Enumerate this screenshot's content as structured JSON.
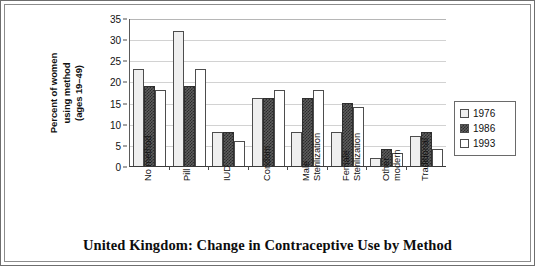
{
  "caption": "United Kingdom: Change in Contraceptive Use by Method",
  "axis": {
    "ylabel": "Percent of women\nusing method\n(ages 19–49)"
  },
  "legend": {
    "items": [
      {
        "label": "1976",
        "swatch": "light-dotted-swatch"
      },
      {
        "label": "1986",
        "swatch": "dark-hatched-swatch"
      },
      {
        "label": "1993",
        "swatch": "white-swatch"
      }
    ]
  },
  "chart_data": {
    "type": "bar",
    "title": "United Kingdom: Change in Contraceptive Use by Method",
    "xlabel": "",
    "ylabel": "Percent of women using method (ages 19–49)",
    "ylim": [
      0,
      35
    ],
    "ytick_values": [
      0,
      5,
      10,
      15,
      20,
      25,
      30,
      35
    ],
    "ytick_labels": [
      "0",
      "5",
      "10",
      "15",
      "20",
      "25",
      "30",
      "35"
    ],
    "grid": true,
    "legend_position": "right",
    "categories": [
      "No method",
      "Pill",
      "IUD",
      "Condom",
      "Male\nSterilization",
      "Female\nSterilization",
      "Other\nmodern",
      "Traditional"
    ],
    "series": [
      {
        "name": "1976",
        "values": [
          23,
          32,
          8,
          16,
          8,
          8,
          2,
          7
        ]
      },
      {
        "name": "1986",
        "values": [
          19,
          19,
          8,
          16,
          16,
          15,
          4,
          8
        ]
      },
      {
        "name": "1993",
        "values": [
          18,
          23,
          6,
          18,
          18,
          14,
          3,
          4
        ]
      }
    ]
  }
}
